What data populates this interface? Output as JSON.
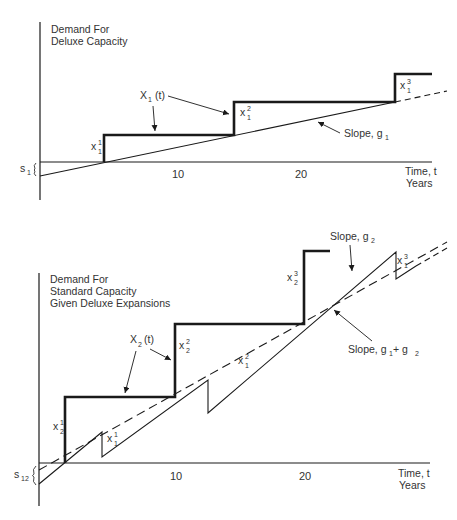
{
  "top_chart": {
    "y_label_line1": "Demand For",
    "y_label_line2": "Deluxe Capacity",
    "x_label_line1": "Time, t",
    "x_label_line2": "Years",
    "ticks": [
      "10",
      "20"
    ],
    "curve_label": "X",
    "curve_label_sub": "1",
    "curve_label_arg": "(t)",
    "slope_label": "Slope, g",
    "slope_label_sub": "1",
    "offset_label": "s",
    "offset_label_sub": "1",
    "steps": [
      {
        "label": "x",
        "sub": "1",
        "sup": "1"
      },
      {
        "label": "x",
        "sub": "1",
        "sup": "2"
      },
      {
        "label": "x",
        "sub": "1",
        "sup": "3"
      }
    ]
  },
  "bottom_chart": {
    "y_label_line1": "Demand For",
    "y_label_line2": "Standard Capacity",
    "y_label_line3": "Given Deluxe Expansions",
    "x_label_line1": "Time, t",
    "x_label_line2": "Years",
    "ticks": [
      "10",
      "20"
    ],
    "curve_label": "X",
    "curve_label_sub": "2",
    "curve_label_arg": "(t)",
    "slope_dashed_label": "Slope, g",
    "slope_dashed_label_sub": "2",
    "slope_solid_label": "Slope, g",
    "slope_solid_label_sub1": "1",
    "slope_solid_label_plus": " + g",
    "slope_solid_label_sub2": "2",
    "offset_label": "s",
    "offset_label_sub": "12",
    "standard_steps": [
      {
        "label": "x",
        "sub": "2",
        "sup": "1"
      },
      {
        "label": "x",
        "sub": "2",
        "sup": "2"
      },
      {
        "label": "x",
        "sub": "2",
        "sup": "3"
      }
    ],
    "deluxe_steps": [
      {
        "label": "x",
        "sub": "1",
        "sup": "1"
      },
      {
        "label": "x",
        "sub": "1",
        "sup": "2"
      },
      {
        "label": "x",
        "sub": "1",
        "sup": "3"
      }
    ]
  },
  "colors": {
    "line": "#1a1a1a",
    "text": "#333333",
    "background": "#ffffff"
  }
}
